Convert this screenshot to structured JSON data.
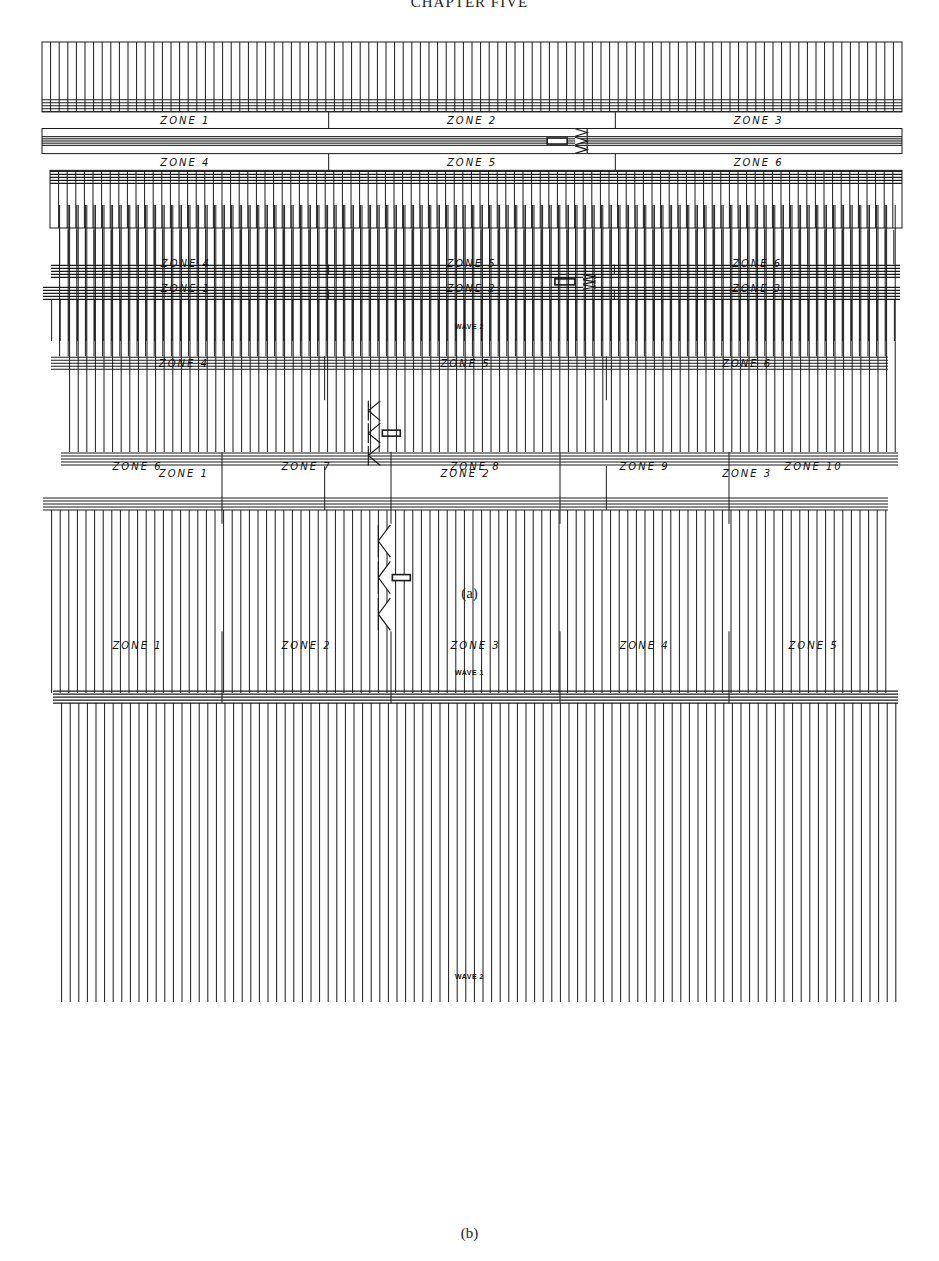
{
  "page": {
    "running_head": "CHAPTER FIVE",
    "page_number": ""
  },
  "figure_a": {
    "caption": "(a)",
    "wave1": {
      "title": "",
      "top_zones": [
        "ZONE 1",
        "ZONE 2",
        "ZONE 3"
      ],
      "bottom_zones": [
        "ZONE 4",
        "ZONE 5",
        "ZONE 6"
      ],
      "vehicle_direction": "right"
    },
    "wave2": {
      "title": "WAVE 2",
      "top_zones": [
        "ZONE 1",
        "ZONE 2",
        "ZONE 3"
      ],
      "bottom_zones": [
        "ZONE 4",
        "ZONE 5",
        "ZONE 6"
      ],
      "vehicle_direction": "right"
    }
  },
  "figure_b": {
    "caption": "(b)",
    "wave1": {
      "title": "WAVE 1",
      "top_zones": [
        "ZONE 1",
        "ZONE 2",
        "ZONE 3"
      ],
      "bottom_zones": [
        "ZONE 4",
        "ZONE 5",
        "ZONE 6"
      ],
      "vehicle_direction": "left"
    },
    "wave2": {
      "title": "WAVE 2",
      "top_zones": [
        "ZONE 1",
        "ZONE 2",
        "ZONE 3",
        "ZONE 4",
        "ZONE 5"
      ],
      "bottom_zones": [
        "ZONE 6",
        "ZONE 7",
        "ZONE 8",
        "ZONE 9",
        "ZONE 10"
      ],
      "vehicle_direction": "left"
    }
  }
}
